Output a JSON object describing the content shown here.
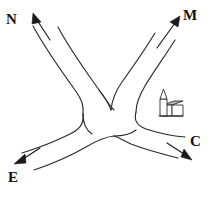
{
  "diagram": {
    "background_color": "#ffffff",
    "line_color": "#2b2b2b",
    "width": 214,
    "height": 197,
    "labels": [
      {
        "id": "N",
        "text": "N",
        "position": "top-left",
        "arm": "north-west"
      },
      {
        "id": "M",
        "text": "M",
        "position": "top-right",
        "arm": "north-east"
      },
      {
        "id": "E",
        "text": "E",
        "position": "bottom-left",
        "arm": "south-west"
      },
      {
        "id": "C",
        "text": "C",
        "position": "bottom-right",
        "arm": "south-east"
      }
    ],
    "arrows": [
      {
        "id": "arrow-n",
        "direction": "up-left",
        "points_to": "N"
      },
      {
        "id": "arrow-m",
        "direction": "up-right",
        "points_to": "M"
      },
      {
        "id": "arrow-e",
        "direction": "down-left",
        "points_to": "E"
      },
      {
        "id": "arrow-c",
        "direction": "down-right",
        "points_to": "C"
      }
    ],
    "landmark": {
      "id": "church",
      "symbol": "church-icon",
      "roof_color": "#b9b9b9",
      "body_color": "#ffffff",
      "quadrant": "east"
    }
  }
}
